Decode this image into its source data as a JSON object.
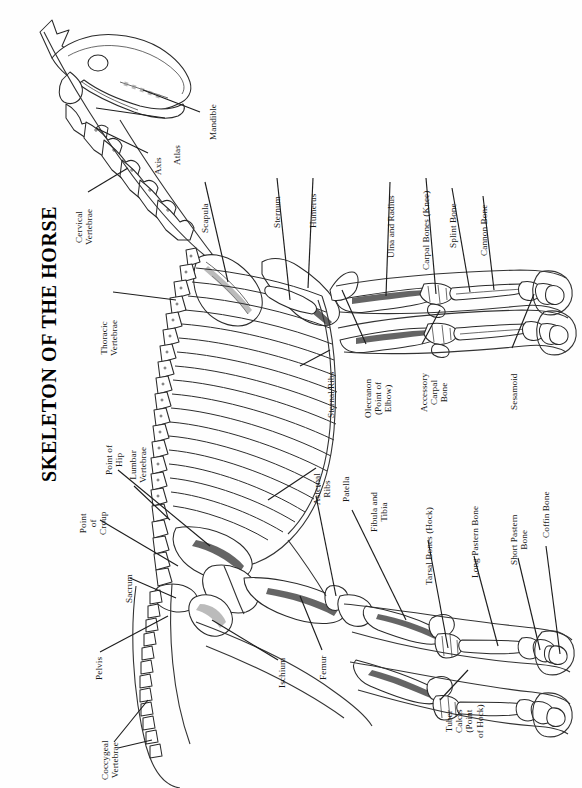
{
  "figure": {
    "title": "SKELETON OF THE HORSE",
    "orientation": "rotated-90-counterclockwise",
    "background_color": "#ffffff",
    "line_color": "#2a2a2a"
  },
  "labels": [
    {
      "id": "mandible",
      "text": "Mandible"
    },
    {
      "id": "atlas",
      "text": "Atlas"
    },
    {
      "id": "axis",
      "text": "Axis"
    },
    {
      "id": "cervical-vertebrae",
      "text": "Cervical\nVertebrae"
    },
    {
      "id": "scapula",
      "text": "Scapula"
    },
    {
      "id": "sternum",
      "text": "Sternum"
    },
    {
      "id": "humerus",
      "text": "Humerus"
    },
    {
      "id": "ulna-and-radius",
      "text": "Ulna and Radius"
    },
    {
      "id": "carpal-bones-knee",
      "text": "Carpal Bones (Knee)"
    },
    {
      "id": "splint-bone",
      "text": "Splint Bone"
    },
    {
      "id": "cannon-bone",
      "text": "Cannon Bone"
    },
    {
      "id": "thoracic-vertebrae",
      "text": "Thoracic\nVertebrae"
    },
    {
      "id": "sternal-ribs",
      "text": "Sternal Ribs"
    },
    {
      "id": "olecranon",
      "text": "Olecranon\n(Point of\nElbow)"
    },
    {
      "id": "accessory-carpal-bone",
      "text": "Accessory\nCarpal\nBone"
    },
    {
      "id": "sesamoid",
      "text": "Sesamoid"
    },
    {
      "id": "point-of-hip",
      "text": "Point of\nHip"
    },
    {
      "id": "lumbar-vertebrae",
      "text": "Lumbar\nVertebrae"
    },
    {
      "id": "point-of-croup",
      "text": "Point\nof\nCroup"
    },
    {
      "id": "sacrum",
      "text": "Sacrum"
    },
    {
      "id": "asternal-ribs",
      "text": "Asternal\nRibs"
    },
    {
      "id": "patella",
      "text": "Patella"
    },
    {
      "id": "fibula-and-tibia",
      "text": "Fibula and\nTibia"
    },
    {
      "id": "tarsal-bones-hock",
      "text": "Tarsal Bones (Hock)"
    },
    {
      "id": "long-pastern-bone",
      "text": "Long Pastern Bone"
    },
    {
      "id": "short-pastern-bone",
      "text": "Short Pastern\nBone"
    },
    {
      "id": "coffin-bone",
      "text": "Coffin Bone"
    },
    {
      "id": "pelvis",
      "text": "Pelvis"
    },
    {
      "id": "ischium",
      "text": "Ischium"
    },
    {
      "id": "femur",
      "text": "Femur"
    },
    {
      "id": "tuber-calcis",
      "text": "Tuber\nCalcis\n(Point\nof Hock)"
    },
    {
      "id": "coccygeal-vertebrae",
      "text": "Coccygeal\nVertebrae"
    }
  ]
}
